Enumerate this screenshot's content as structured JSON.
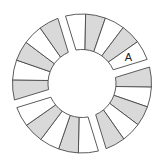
{
  "diagram": {
    "type": "segmented-ring",
    "center": [
      82,
      83.5
    ],
    "outer_radius": 69.5,
    "inner_radius": 34,
    "gap_half_width": 4,
    "colors": {
      "shaded": "#d9d9d9",
      "unshaded": "#ffffff",
      "stroke": "#4a4a4a"
    },
    "gaps_deg": [
      -17,
      73,
      163,
      253
    ],
    "groups": [
      {
        "name": "top-right-group",
        "segments": [
          "shaded",
          "unshaded",
          "shaded",
          "unshaded",
          "shaded"
        ]
      },
      {
        "name": "right-lower-group",
        "segments": [
          "unshaded",
          "shaded",
          "unshaded",
          "shaded",
          "unshaded"
        ]
      },
      {
        "name": "bottom-group",
        "segments": [
          "shaded",
          "unshaded",
          "shaded",
          "unshaded",
          "shaded"
        ]
      },
      {
        "name": "left-group",
        "segments": [
          "unshaded",
          "shaded",
          "unshaded",
          "shaded",
          "unshaded"
        ]
      }
    ],
    "labels": [
      {
        "text": "A",
        "group": 3,
        "segment": 4
      }
    ]
  }
}
